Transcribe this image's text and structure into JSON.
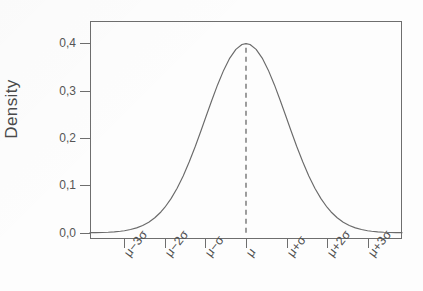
{
  "chart_data": {
    "type": "line",
    "title": "",
    "subtitle": "",
    "xlabel": "",
    "ylabel": "Density",
    "grid": false,
    "legend": false,
    "legend_position": "none",
    "x_tick_labels": [
      "μ−3σ",
      "μ−2σ",
      "μ−σ",
      "μ",
      "μ+σ",
      "μ+2σ",
      "μ+3σ"
    ],
    "x_tick_values": [
      -3,
      -2,
      -1,
      0,
      1,
      2,
      3
    ],
    "xlim": [
      -3.85,
      3.85
    ],
    "y_tick_labels": [
      "0,0",
      "0,1",
      "0,2",
      "0,3",
      "0,4"
    ],
    "y_tick_values": [
      0.0,
      0.1,
      0.2,
      0.3,
      0.4
    ],
    "ylim": [
      -0.013,
      0.4465
    ],
    "series": [
      {
        "name": "Normal density",
        "color": "#6a6a6a",
        "style": "solid",
        "x": [
          -3.85,
          -3.7,
          -3.55,
          -3.4,
          -3.25,
          -3.1,
          -3.0,
          -2.85,
          -2.7,
          -2.55,
          -2.4,
          -2.25,
          -2.1,
          -2.0,
          -1.85,
          -1.7,
          -1.55,
          -1.4,
          -1.25,
          -1.1,
          -1.0,
          -0.85,
          -0.7,
          -0.55,
          -0.4,
          -0.25,
          -0.1,
          0.0,
          0.1,
          0.25,
          0.4,
          0.55,
          0.7,
          0.85,
          1.0,
          1.1,
          1.25,
          1.4,
          1.55,
          1.7,
          1.85,
          2.0,
          2.1,
          2.25,
          2.4,
          2.55,
          2.7,
          2.85,
          3.0,
          3.1,
          3.25,
          3.4,
          3.55,
          3.7,
          3.85
        ],
        "y": [
          0.0003,
          0.0004,
          0.0007,
          0.0012,
          0.002,
          0.0033,
          0.0044,
          0.007,
          0.0104,
          0.0154,
          0.0224,
          0.0317,
          0.044,
          0.054,
          0.0721,
          0.094,
          0.12,
          0.1497,
          0.1826,
          0.2179,
          0.242,
          0.278,
          0.3123,
          0.3429,
          0.3683,
          0.3867,
          0.397,
          0.3989,
          0.397,
          0.3867,
          0.3683,
          0.3429,
          0.3123,
          0.278,
          0.242,
          0.2179,
          0.1826,
          0.1497,
          0.12,
          0.094,
          0.0721,
          0.054,
          0.044,
          0.0317,
          0.0224,
          0.0154,
          0.0104,
          0.007,
          0.0044,
          0.0033,
          0.002,
          0.0012,
          0.0007,
          0.0004,
          0.0003
        ]
      }
    ],
    "annotations": [
      {
        "name": "mean-reference-line",
        "type": "vline",
        "x": 0,
        "y_from": 0.0,
        "y_to": 0.3989,
        "style": "dashed",
        "color": "#6a6a6a"
      }
    ]
  },
  "axes": {
    "y_title": "Density",
    "y_ticks": [
      {
        "label": "0,0",
        "value": 0.0
      },
      {
        "label": "0,1",
        "value": 0.1
      },
      {
        "label": "0,2",
        "value": 0.2
      },
      {
        "label": "0,3",
        "value": 0.3
      },
      {
        "label": "0,4",
        "value": 0.4
      }
    ],
    "x_ticks": [
      {
        "label": "μ−3σ",
        "value": -3
      },
      {
        "label": "μ−2σ",
        "value": -2
      },
      {
        "label": "μ−σ",
        "value": -1
      },
      {
        "label": "μ",
        "value": 0
      },
      {
        "label": "μ+σ",
        "value": 1
      },
      {
        "label": "μ+2σ",
        "value": 2
      },
      {
        "label": "μ+3σ",
        "value": 3
      }
    ]
  },
  "style": {
    "axis_color": "#6e6e6e",
    "curve_color": "#6a6a6a",
    "tick_label_color": "#555555",
    "axis_title_color": "#4a4a4a",
    "background": "#fdfdfd"
  }
}
